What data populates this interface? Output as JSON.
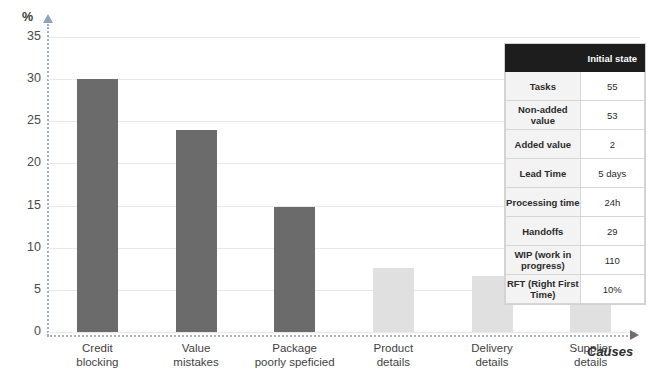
{
  "chart_data": {
    "type": "bar",
    "title": "",
    "subtitle": "",
    "xlabel": "Causes",
    "ylabel": "%",
    "ylim": [
      0,
      37
    ],
    "yticks": [
      0,
      5,
      10,
      15,
      20,
      25,
      30,
      35
    ],
    "ytick_labels": [
      "0",
      "5",
      "10",
      "15",
      "20",
      "25",
      "30",
      "35"
    ],
    "grid": true,
    "legend": "none",
    "categories": [
      "Credit blocking",
      "Value mistakes",
      "Package poorly speficied",
      "Product details",
      "Delivery details",
      "Supplier details"
    ],
    "category_lines": [
      [
        "Credit",
        "blocking"
      ],
      [
        "Value",
        "mistakes"
      ],
      [
        "Package",
        "poorly speficied"
      ],
      [
        "Product",
        "details"
      ],
      [
        "Delivery",
        "details"
      ],
      [
        "Supplier",
        "details"
      ]
    ],
    "values": [
      30,
      24,
      14.8,
      7.6,
      6.7,
      4.8
    ],
    "bar_colors": [
      "#6b6b6b",
      "#6b6b6b",
      "#6b6b6b",
      "#e0e0e0",
      "#e0e0e0",
      "#e0e0e0"
    ],
    "series": [
      {
        "name": "Causes share",
        "values": [
          30,
          24,
          14.8,
          7.6,
          6.7,
          4.8
        ]
      }
    ]
  },
  "axis": {
    "y_unit": "%",
    "x_title": "Causes"
  },
  "table": {
    "header": {
      "blank": "",
      "column": "Initial state"
    },
    "rows": [
      {
        "label": "Tasks",
        "value": "55"
      },
      {
        "label": "Non-added value",
        "value": "53"
      },
      {
        "label": "Added value",
        "value": "2"
      },
      {
        "label": "Lead Time",
        "value": "5 days"
      },
      {
        "label": "Processing time",
        "value": "24h"
      },
      {
        "label": "Handoffs",
        "value": "29"
      },
      {
        "label": "WIP (work in progress)",
        "value": "110"
      },
      {
        "label": "RFT (Right First Time)",
        "value": "10%"
      }
    ]
  },
  "colors": {
    "bar_dark": "#6b6b6b",
    "bar_light": "#e0e0e0",
    "gridline": "#e9e9e9",
    "axis_dotted": "#9fb0c8",
    "table_header_bg": "#1d1d1d",
    "table_label_bg": "#f3f3f3"
  }
}
